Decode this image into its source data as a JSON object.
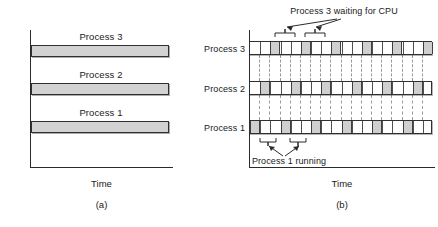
{
  "figure": {
    "gray_fill": "#d2d2d2",
    "slice_fill": "#cfcfcf",
    "line_color": "#303030",
    "grid_color": "#9a9a9a"
  },
  "panel_a": {
    "caption": "(a)",
    "axis_x_title": "Time",
    "bars": [
      {
        "label": "Process 3"
      },
      {
        "label": "Process 2"
      },
      {
        "label": "Process 1"
      }
    ]
  },
  "panel_b": {
    "caption": "(b)",
    "axis_x_title": "Time",
    "rows": [
      {
        "label": "Process 3"
      },
      {
        "label": "Process 2"
      },
      {
        "label": "Process 1"
      }
    ],
    "annotation_top": "Process 3 waiting for CPU",
    "annotation_bottom": "Process 1 running"
  },
  "chart_data": {
    "type": "bar",
    "xlabel": "Time",
    "ylabel": "",
    "grid": true,
    "legend": null,
    "panels": [
      {
        "id": "a",
        "caption": "(a)",
        "description": "Conceptual model: each process appears to run continuously on its own CPU",
        "xlabel": "Time",
        "categories": [
          "Process 3",
          "Process 2",
          "Process 1"
        ],
        "values": [
          1,
          1,
          1
        ],
        "note": "Each bar spans the full time axis with no gaps"
      },
      {
        "id": "b",
        "caption": "(b)",
        "description": "Actual round-robin interleaving: only one process runs at a time",
        "xlabel": "Time",
        "categories": [
          "Process 3",
          "Process 2",
          "Process 1"
        ],
        "time_slots": 18,
        "series": [
          {
            "name": "Process 3",
            "running_slots": [
              2,
              5,
              8,
              11,
              14,
              17
            ]
          },
          {
            "name": "Process 2",
            "running_slots": [
              1,
              4,
              7,
              10,
              13,
              16
            ]
          },
          {
            "name": "Process 1",
            "running_slots": [
              0,
              3,
              6,
              9,
              12,
              15
            ]
          }
        ],
        "annotations": [
          {
            "text": "Process 3 waiting for CPU",
            "target_rows": [
              "Process 3"
            ],
            "position": "above"
          },
          {
            "text": "Process 1 running",
            "target_rows": [
              "Process 1"
            ],
            "position": "below"
          }
        ]
      }
    ]
  }
}
